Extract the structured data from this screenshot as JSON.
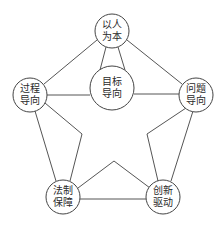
{
  "diagram": {
    "nodes": [
      {
        "id": "center",
        "line1": "目标",
        "line2": "导向",
        "cx": 112,
        "cy": 88,
        "r": 22
      },
      {
        "id": "top",
        "line1": "以人",
        "line2": "为本",
        "cx": 112,
        "cy": 31,
        "r": 17
      },
      {
        "id": "left",
        "line1": "过程",
        "line2": "导向",
        "cx": 30,
        "cy": 95,
        "r": 17
      },
      {
        "id": "right",
        "line1": "问题",
        "line2": "导向",
        "cx": 196,
        "cy": 95,
        "r": 17
      },
      {
        "id": "bottom_left",
        "line1": "法制",
        "line2": "保障",
        "cx": 63,
        "cy": 197,
        "r": 17
      },
      {
        "id": "bottom_right",
        "line1": "创新",
        "line2": "驱动",
        "cx": 163,
        "cy": 197,
        "r": 17
      }
    ],
    "colors": {
      "stroke": "#555555",
      "text": "#2a2a2a",
      "background": "#ffffff"
    }
  }
}
